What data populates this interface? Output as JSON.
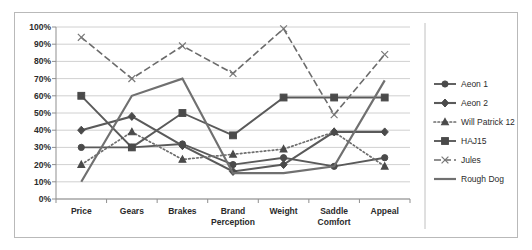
{
  "chart_data": {
    "type": "line",
    "title": "",
    "xlabel": "",
    "ylabel": "",
    "ylim": [
      0,
      100
    ],
    "grid": true,
    "legend_position": "right",
    "tick_suffix": "%",
    "categories": [
      "Price",
      "Gears",
      "Brakes",
      "Brand Perception",
      "Weight",
      "Saddle Comfort",
      "Appeal"
    ],
    "category_lines": [
      [
        "Price"
      ],
      [
        "Gears"
      ],
      [
        "Brakes"
      ],
      [
        "Brand",
        "Perception"
      ],
      [
        "Weight"
      ],
      [
        "Saddle",
        "Comfort"
      ],
      [
        "Appeal"
      ]
    ],
    "ytick_labels": [
      "100%",
      "90%",
      "80%",
      "70%",
      "60%",
      "50%",
      "40%",
      "30%",
      "20%",
      "10%",
      "0%"
    ],
    "ytick_values": [
      100,
      90,
      80,
      70,
      60,
      50,
      40,
      30,
      20,
      10,
      0
    ],
    "series": [
      {
        "name": "Aeon 1",
        "marker": "circle",
        "style": "solid",
        "color": "#5a5a5a",
        "values": [
          30,
          30,
          32,
          20,
          24,
          19,
          24
        ]
      },
      {
        "name": "Aeon 2",
        "marker": "diamond",
        "style": "solid-dotjoin",
        "color": "#5a5a5a",
        "values": [
          40,
          48,
          31,
          16,
          20,
          39,
          39
        ]
      },
      {
        "name": "Will Patrick 12",
        "marker": "triangle",
        "style": "dotted",
        "color": "#6e6e6e",
        "values": [
          20,
          39,
          23,
          26,
          29,
          39,
          19
        ]
      },
      {
        "name": "HAJ15",
        "marker": "square",
        "style": "solid",
        "color": "#5a5a5a",
        "values": [
          60,
          30,
          50,
          37,
          59,
          59,
          59
        ]
      },
      {
        "name": "Jules",
        "marker": "cross",
        "style": "dashed",
        "color": "#6b6b6b",
        "values": [
          94,
          70,
          89,
          73,
          99,
          49,
          84
        ]
      },
      {
        "name": "Rough Dog",
        "marker": "none",
        "style": "solid-thick",
        "color": "#707070",
        "values": [
          10,
          60,
          70,
          15,
          15,
          19,
          69
        ]
      }
    ]
  },
  "legend": {
    "items": [
      {
        "label": "Aeon 1",
        "key": "aeon-1"
      },
      {
        "label": "Aeon 2",
        "key": "aeon-2"
      },
      {
        "label": "Will Patrick 12",
        "key": "will-patrick-12"
      },
      {
        "label": "HAJ15",
        "key": "haj15"
      },
      {
        "label": "Jules",
        "key": "jules"
      },
      {
        "label": "Rough Dog",
        "key": "rough-dog"
      }
    ]
  }
}
